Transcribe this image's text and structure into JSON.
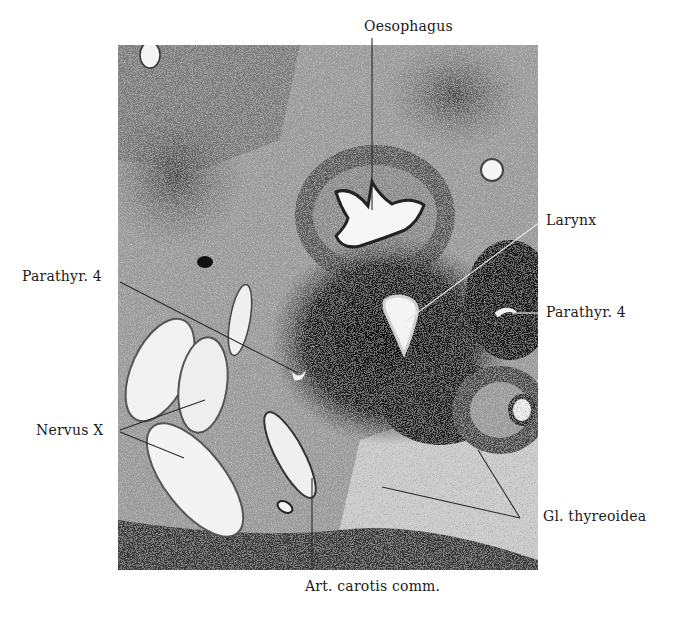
{
  "figure": {
    "type": "histological-section",
    "labels": {
      "oesophagus": "Oesophagus",
      "larynx": "Larynx",
      "parathyr_left": "Parathyr. 4",
      "parathyr_right": "Parathyr. 4",
      "nervus_x": "Nervus X",
      "gl_thyreoidea": "Gl. thyreoidea",
      "art_carotis": "Art. carotis comm."
    },
    "colors": {
      "background": "#ffffff",
      "tissue_dark": "#1a1a1a",
      "tissue_mid": "#6e6e6e",
      "tissue_light": "#d4d4d4",
      "lumen": "#f6f6f6",
      "leader_line": "#2a2a2a"
    }
  }
}
